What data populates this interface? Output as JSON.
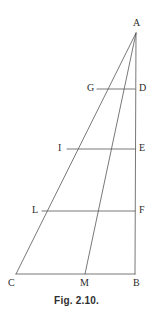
{
  "figure": {
    "caption": "Fig. 2.10.",
    "stroke_color": "#555555",
    "label_color": "#2b2b2b",
    "background_color": "#ffffff",
    "stroke_width": 0.8
  },
  "points": {
    "A": {
      "label": "A",
      "x": 136,
      "y": 33,
      "label_x": 133,
      "label_y": 18
    },
    "B": {
      "label": "B",
      "x": 135,
      "y": 274,
      "label_x": 133,
      "label_y": 278
    },
    "C": {
      "label": "C",
      "x": 16,
      "y": 274,
      "label_x": 8,
      "label_y": 278
    },
    "M": {
      "label": "M",
      "x": 85,
      "y": 274,
      "label_x": 80,
      "label_y": 278
    },
    "G": {
      "label": "G",
      "x": 97,
      "y": 89,
      "label_x": 87,
      "label_y": 83
    },
    "D": {
      "label": "D",
      "x": 135,
      "y": 89,
      "label_x": 139,
      "label_y": 83
    },
    "I": {
      "label": "I",
      "x": 67,
      "y": 149,
      "label_x": 58,
      "label_y": 143
    },
    "E": {
      "label": "E",
      "x": 135,
      "y": 149,
      "label_x": 139,
      "label_y": 143
    },
    "L": {
      "label": "L",
      "x": 42,
      "y": 211,
      "label_x": 32,
      "label_y": 205
    },
    "F": {
      "label": "F",
      "x": 135,
      "y": 211,
      "label_x": 139,
      "label_y": 205
    }
  },
  "segments": [
    {
      "name": "side-AB",
      "from": "A",
      "to": "B"
    },
    {
      "name": "side-AC",
      "from": "A",
      "to": "C"
    },
    {
      "name": "base-CB",
      "from": "C",
      "to": "B"
    },
    {
      "name": "cevian-AM",
      "from": "A",
      "to": "M"
    },
    {
      "name": "transversal-GD",
      "from": "G",
      "to": "D"
    },
    {
      "name": "transversal-IE",
      "from": "I",
      "to": "E"
    },
    {
      "name": "transversal-LF",
      "from": "L",
      "to": "F"
    }
  ]
}
